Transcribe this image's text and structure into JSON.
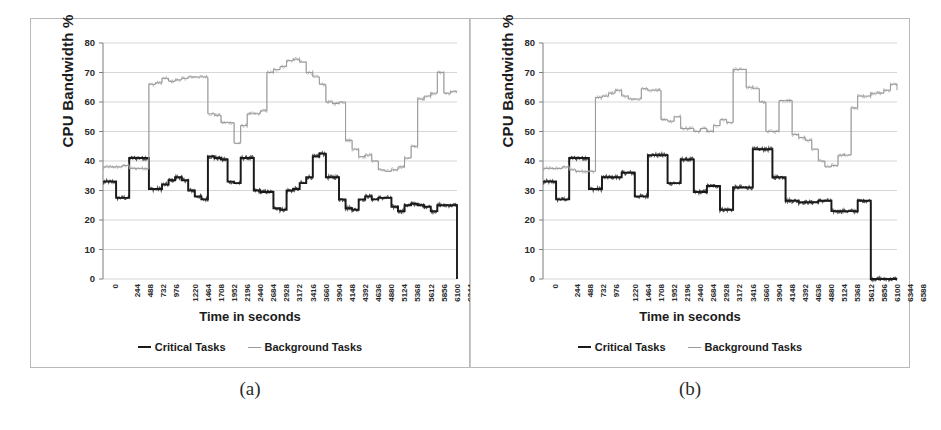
{
  "figure": {
    "panels": [
      {
        "id": "a",
        "caption": "(a)",
        "ylabel": "CPU Bandwidth %",
        "xlabel": "Time in seconds",
        "legend": [
          {
            "label": "Critical Tasks",
            "color": "#1b1b1b",
            "style": "dark"
          },
          {
            "label": "Background Tasks",
            "color": "#9a9a9a",
            "style": "light"
          }
        ]
      },
      {
        "id": "b",
        "caption": "(b)",
        "ylabel": "CPU Bandwidth %",
        "xlabel": "Time in seconds",
        "legend": [
          {
            "label": "Critical Tasks",
            "color": "#1b1b1b",
            "style": "dark"
          },
          {
            "label": "Background Tasks",
            "color": "#9a9a9a",
            "style": "light"
          }
        ]
      }
    ]
  },
  "chart_data": [
    {
      "type": "line",
      "panel": "a",
      "title": "",
      "xlabel": "Time in seconds",
      "ylabel": "CPU Bandwidth %",
      "xlim": [
        0,
        6588
      ],
      "ylim": [
        0,
        80
      ],
      "ytick_step": 10,
      "yticks": [
        0,
        10,
        20,
        30,
        40,
        50,
        60,
        70,
        80
      ],
      "xticks": [
        0,
        244,
        488,
        732,
        976,
        1220,
        1464,
        1708,
        1952,
        2196,
        2440,
        2684,
        2928,
        3172,
        3416,
        3660,
        3904,
        4148,
        4392,
        4636,
        4880,
        5124,
        5368,
        5612,
        5856,
        6100,
        6344,
        6588
      ],
      "grid": true,
      "legend_position": "bottom",
      "series": [
        {
          "name": "Critical Tasks",
          "color": "#1b1b1b",
          "x": [
            0,
            120,
            244,
            366,
            488,
            610,
            732,
            854,
            976,
            1098,
            1220,
            1342,
            1464,
            1586,
            1708,
            1830,
            1952,
            2074,
            2196,
            2318,
            2440,
            2562,
            2684,
            2806,
            2928,
            3050,
            3172,
            3294,
            3416,
            3538,
            3660,
            3782,
            3904,
            4026,
            4148,
            4270,
            4392,
            4514,
            4636,
            4758,
            4880,
            5002,
            5124,
            5246,
            5368,
            5490,
            5612,
            5734,
            5856,
            5978,
            6100,
            6222,
            6344,
            6466,
            6588
          ],
          "values": [
            33,
            33,
            27.5,
            27.5,
            41,
            41,
            41,
            30.5,
            30.5,
            32,
            33.5,
            34.5,
            33.5,
            30,
            28,
            27,
            41.5,
            41,
            40.5,
            33,
            32.5,
            41,
            41,
            30,
            29.5,
            29.5,
            24,
            23.5,
            30,
            30.5,
            32.5,
            34.5,
            41.5,
            42.5,
            34.5,
            34.5,
            27,
            24,
            23.5,
            27,
            28,
            27,
            27.5,
            27.5,
            24.5,
            23,
            25,
            25.5,
            25,
            24.5,
            23,
            25,
            25,
            25,
            0
          ]
        },
        {
          "name": "Background Tasks",
          "color": "#9a9a9a",
          "x": [
            0,
            120,
            244,
            366,
            488,
            610,
            732,
            854,
            976,
            1098,
            1220,
            1342,
            1464,
            1586,
            1708,
            1830,
            1952,
            2074,
            2196,
            2318,
            2440,
            2562,
            2684,
            2806,
            2928,
            3050,
            3172,
            3294,
            3416,
            3538,
            3660,
            3782,
            3904,
            4026,
            4148,
            4270,
            4392,
            4514,
            4636,
            4758,
            4880,
            5002,
            5124,
            5246,
            5368,
            5490,
            5612,
            5734,
            5856,
            5978,
            6100,
            6222,
            6344,
            6466,
            6588
          ],
          "values": [
            38,
            38,
            38,
            38.5,
            37.5,
            37.5,
            37.5,
            66,
            66.5,
            68,
            67,
            67.5,
            68,
            68.5,
            68.5,
            68.5,
            56,
            55.5,
            53,
            53,
            46,
            52,
            56,
            56,
            57,
            70,
            71,
            72,
            74,
            74.5,
            73.5,
            70,
            68.5,
            66,
            60,
            59.5,
            60,
            47,
            44,
            41.5,
            42,
            40,
            37,
            36.5,
            37,
            38,
            41,
            45,
            61,
            62,
            63,
            70,
            63,
            63.5,
            63.5
          ]
        }
      ]
    },
    {
      "type": "line",
      "panel": "b",
      "title": "",
      "xlabel": "Time in seconds",
      "ylabel": "CPU Bandwidth %",
      "xlim": [
        0,
        6588
      ],
      "ylim": [
        0,
        80
      ],
      "ytick_step": 10,
      "yticks": [
        0,
        10,
        20,
        30,
        40,
        50,
        60,
        70,
        80
      ],
      "xticks": [
        0,
        244,
        488,
        732,
        976,
        1220,
        1464,
        1708,
        1952,
        2196,
        2440,
        2684,
        2928,
        3172,
        3416,
        3660,
        3904,
        4148,
        4392,
        4636,
        4880,
        5124,
        5368,
        5612,
        5856,
        6100,
        6344,
        6588
      ],
      "grid": true,
      "legend_position": "bottom",
      "series": [
        {
          "name": "Critical Tasks",
          "color": "#1b1b1b",
          "x": [
            0,
            122,
            244,
            366,
            488,
            610,
            732,
            854,
            976,
            1098,
            1220,
            1342,
            1464,
            1586,
            1708,
            1830,
            1952,
            2074,
            2196,
            2318,
            2440,
            2562,
            2684,
            2806,
            2928,
            3050,
            3172,
            3294,
            3416,
            3538,
            3660,
            3782,
            3904,
            4026,
            4148,
            4270,
            4392,
            4514,
            4636,
            4758,
            4880,
            5002,
            5124,
            5246,
            5368,
            5490,
            5612,
            5734,
            5856,
            5978,
            6100,
            6222,
            6344,
            6466,
            6588
          ],
          "values": [
            33,
            33,
            27,
            27,
            41,
            41,
            41,
            30.5,
            30.5,
            34.5,
            34.5,
            34.5,
            36,
            36,
            28,
            28,
            42,
            42,
            42,
            32.5,
            32.5,
            40.5,
            40.5,
            29.5,
            29.5,
            31.5,
            31.5,
            23.5,
            23.5,
            31,
            31,
            31,
            44,
            44,
            44,
            34.5,
            34.5,
            26.5,
            26.5,
            26,
            26,
            26,
            26.5,
            26.5,
            23,
            23,
            23,
            23,
            26.5,
            26.5,
            0,
            0,
            0,
            0,
            0
          ]
        },
        {
          "name": "Background Tasks",
          "color": "#9a9a9a",
          "x": [
            0,
            122,
            244,
            366,
            488,
            610,
            732,
            854,
            976,
            1098,
            1220,
            1342,
            1464,
            1586,
            1708,
            1830,
            1952,
            2074,
            2196,
            2318,
            2440,
            2562,
            2684,
            2806,
            2928,
            3050,
            3172,
            3294,
            3416,
            3538,
            3660,
            3782,
            3904,
            4026,
            4148,
            4270,
            4392,
            4514,
            4636,
            4758,
            4880,
            5002,
            5124,
            5246,
            5368,
            5490,
            5612,
            5734,
            5856,
            5978,
            6100,
            6222,
            6344,
            6466,
            6588
          ],
          "values": [
            37.5,
            37.5,
            37.5,
            38,
            37,
            36.5,
            36.5,
            36.5,
            61.5,
            62,
            63,
            64,
            62,
            61,
            61,
            64.5,
            64,
            64,
            54,
            53.5,
            55,
            51,
            51,
            50,
            51,
            50,
            52,
            54,
            53,
            71,
            71,
            65,
            64.5,
            60,
            50,
            50,
            60.5,
            60.5,
            49,
            48,
            47,
            44,
            40,
            38,
            38.5,
            42,
            42,
            58,
            62,
            62,
            63,
            63,
            64,
            66,
            64
          ]
        }
      ]
    }
  ]
}
